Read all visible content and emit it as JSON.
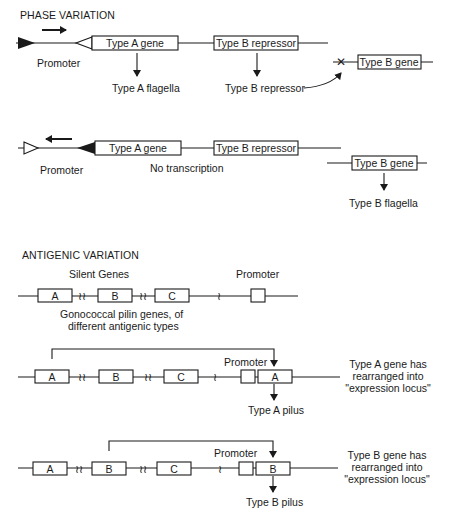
{
  "phase_variation": {
    "title": "PHASE VARIATION",
    "state_on": {
      "promoter_label": "Promoter",
      "gene_a": "Type A gene",
      "repressor_gene": "Type B repressor",
      "product_a": "Type A flagella",
      "product_repressor": "Type B repressor",
      "gene_b": "Type B gene",
      "gene_b_status": "repressed (X)"
    },
    "state_off": {
      "promoter_label": "Promoter",
      "gene_a": "Type A gene",
      "repressor_gene": "Type B repressor",
      "no_transcription": "No transcription",
      "gene_b": "Type B gene",
      "product_b": "Type B flagella"
    }
  },
  "antigenic_variation": {
    "title": "ANTIGENIC VARIATION",
    "silent_genes_label": "Silent Genes",
    "promoter_label": "Promoter",
    "genes_caption_line1": "Gonococcal pilin genes, of",
    "genes_caption_line2": "different antigenic types",
    "genes": [
      "A",
      "B",
      "C"
    ],
    "rearrangement_a": {
      "promoter_label": "Promoter",
      "expressed_gene": "A",
      "product": "Type A pilus",
      "note_line1": "Type A gene has",
      "note_line2": "rearranged into",
      "note_line3": "\"expression locus\""
    },
    "rearrangement_b": {
      "promoter_label": "Promoter",
      "expressed_gene": "B",
      "product": "Type B pilus",
      "note_line1": "Type B gene has",
      "note_line2": "rearranged into",
      "note_line3": "\"expression locus\""
    }
  }
}
